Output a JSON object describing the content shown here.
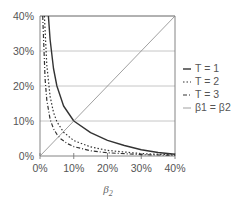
{
  "chart_data": {
    "type": "line",
    "title": "",
    "xlabel": "β2",
    "ylabel": "",
    "xlim": [
      0,
      0.4
    ],
    "ylim": [
      0,
      0.4
    ],
    "x_ticks": [
      "0%",
      "10%",
      "20%",
      "30%",
      "40%"
    ],
    "y_ticks": [
      "0%",
      "10%",
      "20%",
      "30%",
      "40%"
    ],
    "grid": "horizontal",
    "legend_position": "right",
    "series": [
      {
        "name": "T = 1",
        "style": "solid",
        "color": "#333333",
        "x": [
          0.025,
          0.03,
          0.04,
          0.05,
          0.07,
          0.1,
          0.15,
          0.2,
          0.25,
          0.3,
          0.35,
          0.4
        ],
        "y": [
          0.4,
          0.333,
          0.25,
          0.2,
          0.143,
          0.1,
          0.067,
          0.045,
          0.03,
          0.018,
          0.01,
          0.005
        ]
      },
      {
        "name": "T = 2",
        "style": "dotted",
        "color": "#333333",
        "x": [
          0.013,
          0.02,
          0.03,
          0.04,
          0.05,
          0.07,
          0.1,
          0.15,
          0.2,
          0.3,
          0.4
        ],
        "y": [
          0.4,
          0.26,
          0.17,
          0.125,
          0.098,
          0.068,
          0.044,
          0.026,
          0.016,
          0.007,
          0.003
        ]
      },
      {
        "name": "T = 3",
        "style": "dash-dot",
        "color": "#333333",
        "x": [
          0.008,
          0.015,
          0.02,
          0.03,
          0.04,
          0.05,
          0.06,
          0.08,
          0.1,
          0.15,
          0.2,
          0.3,
          0.4
        ],
        "y": [
          0.4,
          0.22,
          0.16,
          0.105,
          0.078,
          0.062,
          0.05,
          0.036,
          0.027,
          0.015,
          0.009,
          0.004,
          0.002
        ]
      },
      {
        "name": "β1 = β2",
        "style": "thin-solid",
        "color": "#888888",
        "x": [
          0,
          0.4
        ],
        "y": [
          0,
          0.4
        ]
      }
    ]
  },
  "legend": {
    "items": [
      {
        "label": "T = 1",
        "symbol": "—"
      },
      {
        "label": "T = 2",
        "symbol": "··"
      },
      {
        "label": "T = 3",
        "symbol": "-·"
      },
      {
        "label": "β1 = β2",
        "symbol": "—"
      }
    ]
  },
  "axes": {
    "x_tick_labels": [
      "0%",
      "10%",
      "20%",
      "30%",
      "40%"
    ],
    "y_tick_labels": [
      "0%",
      "10%",
      "20%",
      "30%",
      "40%"
    ],
    "x_label_main": "β",
    "x_label_sub": "2"
  }
}
